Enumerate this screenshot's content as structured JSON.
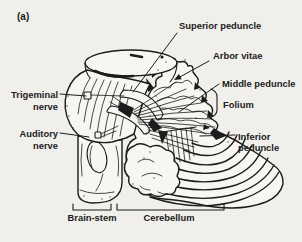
{
  "figure": {
    "tag": "(a)",
    "paper_color": "#f0efeb",
    "ink_color": "#1c1c1c"
  },
  "labels": {
    "superior_peduncle": {
      "text": "Superior peduncle"
    },
    "arbor_vitae": {
      "text": "Arbor vitae"
    },
    "middle_peduncle": {
      "text": "Middle peduncle"
    },
    "folium": {
      "text": "Folium"
    },
    "inferior_peduncle": {
      "line1": "Inferior",
      "line2": "peduncle"
    },
    "trigeminal_nerve": {
      "line1": "Trigeminal",
      "line2": "nerve"
    },
    "auditory_nerve": {
      "line1": "Auditory",
      "line2": "nerve"
    }
  },
  "regions": {
    "brain_stem": "Brain-stem",
    "cerebellum": "Cerebellum"
  }
}
